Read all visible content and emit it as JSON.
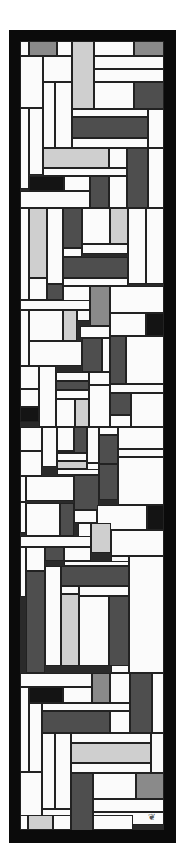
{
  "artwork": {
    "description": "Vertical abstract stained-glass composition of rectangular panes in white, light gray, mid gray, dark gray and black separated by dark lead lines, inside a thick black frame",
    "palette": {
      "frame": "#0b0b0b",
      "lead": "#222222",
      "white": "#fbfbfb",
      "light_gray": "#cfcfcf",
      "mid_gray": "#8a8a8a",
      "dark_gray": "#4e4e4e",
      "black": "#141414"
    },
    "monogram": "❦"
  },
  "panes": [
    {
      "x": 0,
      "y": 0,
      "w": 9,
      "h": 15,
      "c": "white"
    },
    {
      "x": 9,
      "y": 0,
      "w": 28,
      "h": 15,
      "c": "mid_gray"
    },
    {
      "x": 37,
      "y": 0,
      "w": 15,
      "h": 15,
      "c": "white"
    },
    {
      "x": 52,
      "y": 0,
      "w": 22,
      "h": 68,
      "c": "light_gray"
    },
    {
      "x": 74,
      "y": 0,
      "w": 40,
      "h": 15,
      "c": "white"
    },
    {
      "x": 114,
      "y": 0,
      "w": 30,
      "h": 15,
      "c": "mid_gray"
    },
    {
      "x": 0,
      "y": 15,
      "w": 23,
      "h": 52,
      "c": "white"
    },
    {
      "x": 23,
      "y": 15,
      "w": 29,
      "h": 26,
      "c": "white"
    },
    {
      "x": 74,
      "y": 15,
      "w": 70,
      "h": 13,
      "c": "white"
    },
    {
      "x": 74,
      "y": 28,
      "w": 70,
      "h": 13,
      "c": "white"
    },
    {
      "x": 74,
      "y": 41,
      "w": 40,
      "h": 27,
      "c": "white"
    },
    {
      "x": 114,
      "y": 41,
      "w": 30,
      "h": 27,
      "c": "dark_gray"
    },
    {
      "x": 23,
      "y": 41,
      "w": 12,
      "h": 66,
      "c": "white"
    },
    {
      "x": 35,
      "y": 41,
      "w": 17,
      "h": 66,
      "c": "white"
    },
    {
      "x": 52,
      "y": 68,
      "w": 76,
      "h": 8,
      "c": "white"
    },
    {
      "x": 128,
      "y": 68,
      "w": 16,
      "h": 39,
      "c": "white"
    },
    {
      "x": 0,
      "y": 67,
      "w": 9,
      "h": 81,
      "c": "white"
    },
    {
      "x": 9,
      "y": 67,
      "w": 14,
      "h": 67,
      "c": "white"
    },
    {
      "x": 52,
      "y": 76,
      "w": 76,
      "h": 21,
      "c": "dark_gray"
    },
    {
      "x": 52,
      "y": 97,
      "w": 76,
      "h": 10,
      "c": "white"
    },
    {
      "x": 23,
      "y": 107,
      "w": 66,
      "h": 20,
      "c": "light_gray"
    },
    {
      "x": 89,
      "y": 107,
      "w": 18,
      "h": 20,
      "c": "white"
    },
    {
      "x": 107,
      "y": 107,
      "w": 21,
      "h": 60,
      "c": "dark_gray"
    },
    {
      "x": 128,
      "y": 107,
      "w": 16,
      "h": 60,
      "c": "white"
    },
    {
      "x": 23,
      "y": 127,
      "w": 84,
      "h": 8,
      "c": "white"
    },
    {
      "x": 9,
      "y": 135,
      "w": 35,
      "h": 15,
      "c": "black"
    },
    {
      "x": 44,
      "y": 135,
      "w": 26,
      "h": 15,
      "c": "white"
    },
    {
      "x": 70,
      "y": 135,
      "w": 19,
      "h": 32,
      "c": "dark_gray"
    },
    {
      "x": 89,
      "y": 135,
      "w": 18,
      "h": 32,
      "c": "white"
    },
    {
      "x": 0,
      "y": 150,
      "w": 70,
      "h": 17,
      "c": "white"
    },
    {
      "x": 0,
      "y": 167,
      "w": 9,
      "h": 92,
      "c": "white"
    },
    {
      "x": 9,
      "y": 167,
      "w": 18,
      "h": 70,
      "c": "light_gray"
    },
    {
      "x": 27,
      "y": 167,
      "w": 16,
      "h": 76,
      "c": "white"
    },
    {
      "x": 43,
      "y": 167,
      "w": 19,
      "h": 40,
      "c": "dark_gray"
    },
    {
      "x": 62,
      "y": 167,
      "w": 28,
      "h": 36,
      "c": "white"
    },
    {
      "x": 90,
      "y": 167,
      "w": 18,
      "h": 36,
      "c": "light_gray"
    },
    {
      "x": 108,
      "y": 167,
      "w": 18,
      "h": 76,
      "c": "white"
    },
    {
      "x": 126,
      "y": 167,
      "w": 18,
      "h": 76,
      "c": "white"
    },
    {
      "x": 43,
      "y": 207,
      "w": 19,
      "h": 9,
      "c": "white"
    },
    {
      "x": 62,
      "y": 203,
      "w": 46,
      "h": 10,
      "c": "white"
    },
    {
      "x": 43,
      "y": 216,
      "w": 65,
      "h": 21,
      "c": "dark_gray"
    },
    {
      "x": 43,
      "y": 237,
      "w": 65,
      "h": 8,
      "c": "white"
    },
    {
      "x": 9,
      "y": 237,
      "w": 18,
      "h": 22,
      "c": "white"
    },
    {
      "x": 27,
      "y": 243,
      "w": 16,
      "h": 16,
      "c": "dark_gray"
    },
    {
      "x": 43,
      "y": 245,
      "w": 27,
      "h": 15,
      "c": "white"
    },
    {
      "x": 70,
      "y": 245,
      "w": 20,
      "h": 40,
      "c": "mid_gray"
    },
    {
      "x": 90,
      "y": 245,
      "w": 54,
      "h": 27,
      "c": "white"
    },
    {
      "x": 0,
      "y": 259,
      "w": 70,
      "h": 10,
      "c": "white"
    },
    {
      "x": 0,
      "y": 269,
      "w": 9,
      "h": 56,
      "c": "white"
    },
    {
      "x": 9,
      "y": 269,
      "w": 34,
      "h": 31,
      "c": "white"
    },
    {
      "x": 43,
      "y": 269,
      "w": 14,
      "h": 31,
      "c": "light_gray"
    },
    {
      "x": 57,
      "y": 269,
      "w": 13,
      "h": 11,
      "c": "white"
    },
    {
      "x": 90,
      "y": 272,
      "w": 36,
      "h": 23,
      "c": "white"
    },
    {
      "x": 126,
      "y": 272,
      "w": 18,
      "h": 23,
      "c": "black"
    },
    {
      "x": 60,
      "y": 285,
      "w": 30,
      "h": 12,
      "c": "white"
    },
    {
      "x": 62,
      "y": 297,
      "w": 20,
      "h": 34,
      "c": "dark_gray"
    },
    {
      "x": 82,
      "y": 297,
      "w": 8,
      "h": 34,
      "c": "white"
    },
    {
      "x": 90,
      "y": 295,
      "w": 16,
      "h": 48,
      "c": "dark_gray"
    },
    {
      "x": 106,
      "y": 295,
      "w": 38,
      "h": 48,
      "c": "white"
    },
    {
      "x": 9,
      "y": 300,
      "w": 53,
      "h": 25,
      "c": "white"
    },
    {
      "x": 0,
      "y": 325,
      "w": 19,
      "h": 23,
      "c": "white"
    },
    {
      "x": 19,
      "y": 325,
      "w": 17,
      "h": 61,
      "c": "white"
    },
    {
      "x": 36,
      "y": 331,
      "w": 33,
      "h": 9,
      "c": "white"
    },
    {
      "x": 69,
      "y": 331,
      "w": 21,
      "h": 13,
      "c": "white"
    },
    {
      "x": 36,
      "y": 340,
      "w": 33,
      "h": 9,
      "c": "dark_gray"
    },
    {
      "x": 36,
      "y": 349,
      "w": 33,
      "h": 9,
      "c": "white"
    },
    {
      "x": 90,
      "y": 343,
      "w": 54,
      "h": 9,
      "c": "white"
    },
    {
      "x": 0,
      "y": 348,
      "w": 19,
      "h": 18,
      "c": "white"
    },
    {
      "x": 36,
      "y": 358,
      "w": 19,
      "h": 28,
      "c": "white"
    },
    {
      "x": 55,
      "y": 358,
      "w": 14,
      "h": 28,
      "c": "light_gray"
    },
    {
      "x": 69,
      "y": 344,
      "w": 21,
      "h": 42,
      "c": "white"
    },
    {
      "x": 90,
      "y": 352,
      "w": 21,
      "h": 22,
      "c": "dark_gray"
    },
    {
      "x": 111,
      "y": 352,
      "w": 33,
      "h": 34,
      "c": "white"
    },
    {
      "x": 0,
      "y": 366,
      "w": 19,
      "h": 15,
      "c": "black"
    },
    {
      "x": 90,
      "y": 374,
      "w": 21,
      "h": 12,
      "c": "white"
    },
    {
      "x": 0,
      "y": 386,
      "w": 22,
      "h": 24,
      "c": "white"
    },
    {
      "x": 22,
      "y": 386,
      "w": 15,
      "h": 40,
      "c": "white"
    },
    {
      "x": 37,
      "y": 386,
      "w": 17,
      "h": 24,
      "c": "white"
    },
    {
      "x": 54,
      "y": 386,
      "w": 13,
      "h": 26,
      "c": "dark_gray"
    },
    {
      "x": 67,
      "y": 386,
      "w": 12,
      "h": 36,
      "c": "white"
    },
    {
      "x": 79,
      "y": 386,
      "w": 19,
      "h": 8,
      "c": "white"
    },
    {
      "x": 98,
      "y": 386,
      "w": 46,
      "h": 22,
      "c": "white"
    },
    {
      "x": 79,
      "y": 394,
      "w": 19,
      "h": 29,
      "c": "dark_gray"
    },
    {
      "x": 0,
      "y": 410,
      "w": 22,
      "h": 25,
      "c": "white"
    },
    {
      "x": 37,
      "y": 410,
      "w": 17,
      "h": 2,
      "c": "white"
    },
    {
      "x": 37,
      "y": 412,
      "w": 30,
      "h": 8,
      "c": "white"
    },
    {
      "x": 37,
      "y": 420,
      "w": 30,
      "h": 8,
      "c": "light_gray"
    },
    {
      "x": 67,
      "y": 422,
      "w": 12,
      "h": 8,
      "c": "white"
    },
    {
      "x": 98,
      "y": 408,
      "w": 46,
      "h": 8,
      "c": "white"
    },
    {
      "x": 79,
      "y": 423,
      "w": 19,
      "h": 36,
      "c": "dark_gray"
    },
    {
      "x": 98,
      "y": 416,
      "w": 46,
      "h": 48,
      "c": "white"
    },
    {
      "x": 37,
      "y": 428,
      "w": 42,
      "h": 6,
      "c": "white"
    },
    {
      "x": 0,
      "y": 435,
      "w": 6,
      "h": 57,
      "c": "white"
    },
    {
      "x": 6,
      "y": 435,
      "w": 48,
      "h": 25,
      "c": "white"
    },
    {
      "x": 54,
      "y": 434,
      "w": 25,
      "h": 35,
      "c": "dark_gray"
    },
    {
      "x": 0,
      "y": 460,
      "w": 6,
      "h": 2,
      "c": "white"
    },
    {
      "x": 6,
      "y": 462,
      "w": 34,
      "h": 33,
      "c": "white"
    },
    {
      "x": 40,
      "y": 462,
      "w": 14,
      "h": 33,
      "c": "dark_gray"
    },
    {
      "x": 54,
      "y": 469,
      "w": 23,
      "h": 13,
      "c": "white"
    },
    {
      "x": 77,
      "y": 464,
      "w": 50,
      "h": 25,
      "c": "white"
    },
    {
      "x": 127,
      "y": 464,
      "w": 17,
      "h": 25,
      "c": "black"
    },
    {
      "x": 58,
      "y": 482,
      "w": 13,
      "h": 15,
      "c": "white"
    },
    {
      "x": 71,
      "y": 482,
      "w": 20,
      "h": 30,
      "c": "light_gray"
    },
    {
      "x": 91,
      "y": 489,
      "w": 53,
      "h": 26,
      "c": "white"
    },
    {
      "x": 0,
      "y": 495,
      "w": 71,
      "h": 11,
      "c": "white"
    },
    {
      "x": 0,
      "y": 506,
      "w": 6,
      "h": 50,
      "c": "white"
    },
    {
      "x": 6,
      "y": 506,
      "w": 19,
      "h": 24,
      "c": "white"
    },
    {
      "x": 25,
      "y": 506,
      "w": 19,
      "h": 14,
      "c": "dark_gray"
    },
    {
      "x": 44,
      "y": 506,
      "w": 27,
      "h": 14,
      "c": "white"
    },
    {
      "x": 91,
      "y": 515,
      "w": 18,
      "h": 117,
      "c": "white"
    },
    {
      "x": 109,
      "y": 515,
      "w": 35,
      "h": 117,
      "c": "white"
    },
    {
      "x": 44,
      "y": 520,
      "w": 65,
      "h": 5,
      "c": "white"
    },
    {
      "x": 6,
      "y": 530,
      "w": 19,
      "h": 102,
      "c": "dark_gray"
    },
    {
      "x": 25,
      "y": 525,
      "w": 16,
      "h": 100,
      "c": "white"
    },
    {
      "x": 41,
      "y": 525,
      "w": 68,
      "h": 20,
      "c": "dark_gray"
    },
    {
      "x": 41,
      "y": 545,
      "w": 18,
      "h": 8,
      "c": "white"
    },
    {
      "x": 59,
      "y": 545,
      "w": 50,
      "h": 10,
      "c": "white"
    },
    {
      "x": 41,
      "y": 553,
      "w": 18,
      "h": 72,
      "c": "light_gray"
    },
    {
      "x": 59,
      "y": 555,
      "w": 30,
      "h": 70,
      "c": "white"
    },
    {
      "x": 89,
      "y": 555,
      "w": 20,
      "h": 70,
      "c": "dark_gray"
    },
    {
      "x": 0,
      "y": 632,
      "w": 72,
      "h": 14,
      "c": "white"
    },
    {
      "x": 72,
      "y": 632,
      "w": 18,
      "h": 30,
      "c": "mid_gray"
    },
    {
      "x": 90,
      "y": 632,
      "w": 20,
      "h": 30,
      "c": "white"
    },
    {
      "x": 110,
      "y": 632,
      "w": 22,
      "h": 60,
      "c": "dark_gray"
    },
    {
      "x": 132,
      "y": 632,
      "w": 12,
      "h": 60,
      "c": "white"
    },
    {
      "x": 0,
      "y": 646,
      "w": 9,
      "h": 85,
      "c": "white"
    },
    {
      "x": 9,
      "y": 646,
      "w": 34,
      "h": 16,
      "c": "black"
    },
    {
      "x": 43,
      "y": 646,
      "w": 29,
      "h": 16,
      "c": "white"
    },
    {
      "x": 9,
      "y": 662,
      "w": 13,
      "h": 69,
      "c": "white"
    },
    {
      "x": 22,
      "y": 662,
      "w": 88,
      "h": 8,
      "c": "white"
    },
    {
      "x": 22,
      "y": 670,
      "w": 68,
      "h": 22,
      "c": "dark_gray"
    },
    {
      "x": 90,
      "y": 670,
      "w": 20,
      "h": 22,
      "c": "white"
    },
    {
      "x": 22,
      "y": 692,
      "w": 13,
      "h": 76,
      "c": "white"
    },
    {
      "x": 35,
      "y": 692,
      "w": 16,
      "h": 76,
      "c": "white"
    },
    {
      "x": 51,
      "y": 692,
      "w": 80,
      "h": 10,
      "c": "white"
    },
    {
      "x": 131,
      "y": 692,
      "w": 13,
      "h": 40,
      "c": "white"
    },
    {
      "x": 51,
      "y": 702,
      "w": 80,
      "h": 20,
      "c": "light_gray"
    },
    {
      "x": 51,
      "y": 722,
      "w": 80,
      "h": 10,
      "c": "white"
    },
    {
      "x": 0,
      "y": 731,
      "w": 22,
      "h": 56,
      "c": "white"
    },
    {
      "x": 51,
      "y": 732,
      "w": 22,
      "h": 58,
      "c": "dark_gray"
    },
    {
      "x": 73,
      "y": 732,
      "w": 43,
      "h": 26,
      "c": "white"
    },
    {
      "x": 116,
      "y": 732,
      "w": 28,
      "h": 26,
      "c": "mid_gray"
    },
    {
      "x": 22,
      "y": 768,
      "w": 29,
      "h": 26,
      "c": "white"
    },
    {
      "x": 73,
      "y": 758,
      "w": 71,
      "h": 13,
      "c": "white"
    },
    {
      "x": 73,
      "y": 771,
      "w": 71,
      "h": 13,
      "c": "white"
    },
    {
      "x": 0,
      "y": 787,
      "w": 8,
      "h": 2,
      "c": "white"
    }
  ],
  "bottom_strip": [
    {
      "x": 0,
      "y": 774,
      "w": 8,
      "h": 15,
      "c": "white"
    },
    {
      "x": 8,
      "y": 774,
      "w": 25,
      "h": 15,
      "c": "light_gray"
    },
    {
      "x": 33,
      "y": 774,
      "w": 18,
      "h": 15,
      "c": "white"
    },
    {
      "x": 73,
      "y": 774,
      "w": 40,
      "h": 15,
      "c": "white"
    }
  ]
}
